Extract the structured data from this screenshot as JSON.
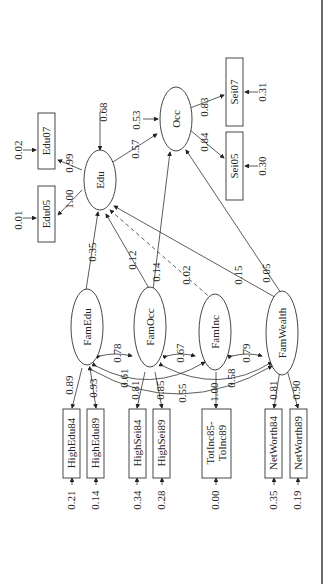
{
  "diagram": {
    "type": "structural-equation-model",
    "orientation": "rotated-90",
    "latent": [
      {
        "id": "Edu",
        "label": "Edu",
        "residual": "0.68"
      },
      {
        "id": "Occ",
        "label": "Occ",
        "residual": "0.53"
      },
      {
        "id": "FamEdu",
        "label": "FamEdu"
      },
      {
        "id": "FamOcc",
        "label": "FamOcc"
      },
      {
        "id": "FamInc",
        "label": "FamInc"
      },
      {
        "id": "FamWealth",
        "label": "FamWealth"
      }
    ],
    "observed": [
      {
        "id": "Edu05",
        "label": "Edu05",
        "error": "0.01",
        "loading": "1.00",
        "factor": "Edu"
      },
      {
        "id": "Edu07",
        "label": "Edu07",
        "error": "0.02",
        "loading": "0.99",
        "factor": "Edu"
      },
      {
        "id": "Sei05",
        "label": "Sei05",
        "error": "0.30",
        "loading": "0.84",
        "factor": "Occ"
      },
      {
        "id": "Sei07",
        "label": "Sei07",
        "error": "0.31",
        "loading": "0.83",
        "factor": "Occ"
      },
      {
        "id": "HighEdu84",
        "label": "HighEdu84",
        "error": "0.21",
        "loading": "0.89",
        "factor": "FamEdu"
      },
      {
        "id": "HighEdu89",
        "label": "HighEdu89",
        "error": "0.14",
        "loading": "0.93",
        "factor": "FamEdu"
      },
      {
        "id": "HighSei84",
        "label": "HighSei84",
        "error": "0.34",
        "loading": "0.81",
        "factor": "FamOcc"
      },
      {
        "id": "HighSei89",
        "label": "HighSei89",
        "error": "0.28",
        "loading": "0.85",
        "factor": "FamOcc"
      },
      {
        "id": "TotInc",
        "label_line1": "TotInc85-",
        "label_line2": "ToInc89",
        "error": "0.00",
        "loading": "1.00",
        "factor": "FamInc"
      },
      {
        "id": "NetWorth84",
        "label": "NetWorth84",
        "error": "0.35",
        "loading": "0.81",
        "factor": "FamWealth"
      },
      {
        "id": "NetWorth89",
        "label": "NetWorth89",
        "error": "0.19",
        "loading": "0.90",
        "factor": "FamWealth"
      }
    ],
    "paths": {
      "edu_to_occ": "0.57",
      "famedu_to_edu": "0.35",
      "famocc_to_edu": "0.12",
      "famocc_to_occ": "0.14",
      "faminc_to_edu": "0.02",
      "famwealth_to_edu": "0.15",
      "famwealth_to_occ": "0.05"
    },
    "covariances": {
      "famedu_famocc": "0.78",
      "famedu_faminc": "0.61",
      "famedu_famwealth": "0.55",
      "famocc_faminc": "0.67",
      "famocc_famwealth": "0.58",
      "faminc_famwealth": "0.79"
    }
  }
}
